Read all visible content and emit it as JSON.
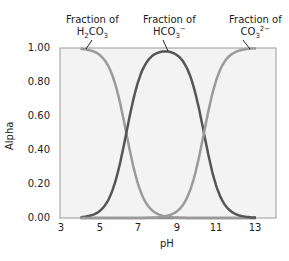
{
  "chart_data": {
    "type": "line",
    "title": "",
    "xlabel": "pH",
    "ylabel": "Alpha",
    "xlim": [
      3,
      14
    ],
    "ylim": [
      0,
      1
    ],
    "x_ticks": [
      "3",
      "5",
      "7",
      "9",
      "11",
      "13"
    ],
    "y_ticks": [
      "0.00",
      "0.20",
      "0.40",
      "0.60",
      "0.80",
      "1.00"
    ],
    "grid": false,
    "legend": "annotations",
    "pKa1": 6.35,
    "pKa2": 10.33,
    "x": [
      4,
      5,
      6,
      6.35,
      7,
      8,
      8.34,
      9,
      10,
      10.33,
      11,
      12,
      13
    ],
    "series": [
      {
        "name": "Fraction of H2CO3",
        "color": "#9a9a9a",
        "values": [
          1.0,
          0.96,
          0.69,
          0.5,
          0.18,
          0.02,
          0.01,
          0.0,
          0.0,
          0.0,
          0.0,
          0.0,
          0.0
        ]
      },
      {
        "name": "Fraction of HCO3-",
        "color": "#555555",
        "values": [
          0.0,
          0.04,
          0.31,
          0.5,
          0.81,
          0.97,
          0.98,
          0.95,
          0.68,
          0.5,
          0.18,
          0.02,
          0.0
        ]
      },
      {
        "name": "Fraction of CO3 2-",
        "color": "#9a9a9a",
        "values": [
          0.0,
          0.0,
          0.0,
          0.0,
          0.0,
          0.01,
          0.01,
          0.05,
          0.32,
          0.5,
          0.82,
          0.98,
          1.0
        ]
      }
    ],
    "annotations": [
      {
        "line1": "Fraction of",
        "line2": "H2CO3",
        "x": 4.3,
        "y": 1.0
      },
      {
        "line1": "Fraction of",
        "line2": "HCO3−",
        "x": 8.3,
        "y": 0.98
      },
      {
        "line1": "Fraction of",
        "line2": "CO3 2−",
        "x": 12.6,
        "y": 1.0
      }
    ]
  },
  "labels": {
    "fraction_of": "Fraction of",
    "h2co3": {
      "a": "H",
      "b": "2",
      "c": "CO",
      "d": "3"
    },
    "hco3": {
      "a": "HCO",
      "b": "3",
      "c": "−"
    },
    "co3": {
      "a": "CO",
      "b": "3",
      "c": "2−"
    }
  }
}
